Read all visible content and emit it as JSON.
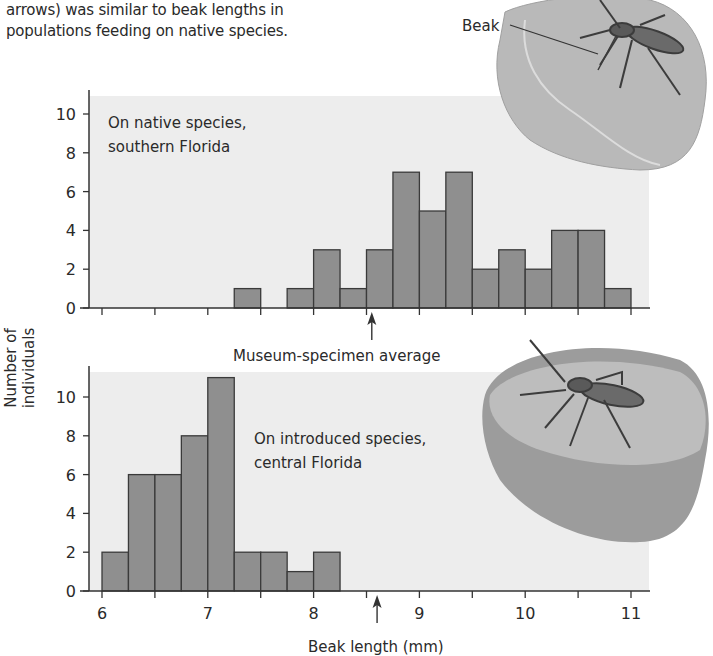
{
  "caption": {
    "line1": "arrows) was similar to beak lengths in",
    "line2": "populations feeding on native species."
  },
  "illustration_labels": {
    "beak": "Beak"
  },
  "colors": {
    "bar_fill": "#8f8f8f",
    "bar_stroke": "#3a3a3a",
    "plot_bg": "#ededed",
    "axis": "#333333",
    "text": "#2a2a2a"
  },
  "chart_data": [
    {
      "type": "bar",
      "subtype": "histogram",
      "panel": "top",
      "title": "On native species, southern Florida",
      "annotation_title_line1": "On native species,",
      "annotation_title_line2": "southern Florida",
      "xlabel": "Beak length (mm)",
      "ylabel": "Number of individuals",
      "xlim": [
        6,
        11
      ],
      "ylim": [
        0,
        10
      ],
      "yticks": [
        0,
        2,
        4,
        6,
        8,
        10
      ],
      "xticks_minor_step": 0.5,
      "bin_width": 0.25,
      "bins": [
        {
          "x0": 7.25,
          "x1": 7.5,
          "count": 1
        },
        {
          "x0": 7.5,
          "x1": 7.75,
          "count": 0
        },
        {
          "x0": 7.75,
          "x1": 8.0,
          "count": 1
        },
        {
          "x0": 8.0,
          "x1": 8.25,
          "count": 3
        },
        {
          "x0": 8.25,
          "x1": 8.5,
          "count": 1
        },
        {
          "x0": 8.5,
          "x1": 8.75,
          "count": 3
        },
        {
          "x0": 8.75,
          "x1": 9.0,
          "count": 7
        },
        {
          "x0": 9.0,
          "x1": 9.25,
          "count": 5
        },
        {
          "x0": 9.25,
          "x1": 9.5,
          "count": 7
        },
        {
          "x0": 9.5,
          "x1": 9.75,
          "count": 2
        },
        {
          "x0": 9.75,
          "x1": 10.0,
          "count": 3
        },
        {
          "x0": 10.0,
          "x1": 10.25,
          "count": 2
        },
        {
          "x0": 10.25,
          "x1": 10.5,
          "count": 4
        },
        {
          "x0": 10.5,
          "x1": 10.75,
          "count": 4
        },
        {
          "x0": 10.75,
          "x1": 11.0,
          "count": 1
        }
      ],
      "marker": {
        "label": "Museum-specimen average",
        "x": 8.55
      }
    },
    {
      "type": "bar",
      "subtype": "histogram",
      "panel": "bottom",
      "title": "On introduced species, central Florida",
      "annotation_title_line1": "On introduced species,",
      "annotation_title_line2": "central Florida",
      "xlabel": "Beak length (mm)",
      "ylabel": "Number of individuals",
      "xlim": [
        6,
        11
      ],
      "ylim": [
        0,
        10
      ],
      "yticks": [
        0,
        2,
        4,
        6,
        8,
        10
      ],
      "xticks": [
        6,
        7,
        8,
        9,
        10,
        11
      ],
      "xtick_labels": [
        "6",
        "7",
        "8",
        "9",
        "10",
        "11"
      ],
      "xticks_minor_step": 0.5,
      "bin_width": 0.25,
      "bins": [
        {
          "x0": 6.0,
          "x1": 6.25,
          "count": 2
        },
        {
          "x0": 6.25,
          "x1": 6.5,
          "count": 6
        },
        {
          "x0": 6.5,
          "x1": 6.75,
          "count": 6
        },
        {
          "x0": 6.75,
          "x1": 7.0,
          "count": 8
        },
        {
          "x0": 7.0,
          "x1": 7.25,
          "count": 11
        },
        {
          "x0": 7.25,
          "x1": 7.5,
          "count": 2
        },
        {
          "x0": 7.5,
          "x1": 7.75,
          "count": 2
        },
        {
          "x0": 7.75,
          "x1": 8.0,
          "count": 1
        },
        {
          "x0": 8.0,
          "x1": 8.25,
          "count": 2
        }
      ],
      "marker": {
        "label": "Museum-specimen average",
        "x": 8.6
      }
    }
  ]
}
